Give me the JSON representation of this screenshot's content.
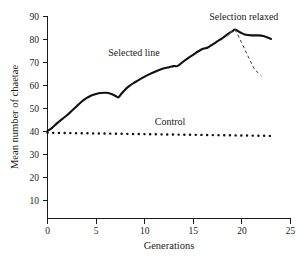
{
  "chart_data": {
    "type": "line",
    "title": "",
    "xlabel": "Generations",
    "ylabel": "Mean number of chaetae",
    "xlim": [
      0,
      25
    ],
    "ylim": [
      0,
      90
    ],
    "xticks": [
      0,
      5,
      10,
      15,
      20,
      25
    ],
    "yticks": [
      10,
      20,
      30,
      40,
      50,
      60,
      70,
      80,
      90
    ],
    "xtick_labels": [
      "0",
      "5",
      "10",
      "15",
      "20",
      "25"
    ],
    "ytick_labels": [
      "10",
      "20",
      "30",
      "40",
      "50",
      "60",
      "70",
      "80",
      "90"
    ],
    "grid": false,
    "legend_position": "inline-annotations",
    "series": [
      {
        "name": "Selected line",
        "style": "solid",
        "color": "#111111",
        "x": [
          0,
          0.5,
          1,
          1.5,
          2,
          2.5,
          3,
          3.5,
          4,
          4.5,
          5,
          5.5,
          6,
          6.5,
          7,
          7.3,
          7.6,
          8,
          8.5,
          9,
          9.5,
          10,
          10.5,
          11,
          11.5,
          12,
          12.5,
          13,
          13.4,
          14,
          14.5,
          15,
          15.5,
          16,
          16.5,
          17,
          17.5,
          18,
          18.5,
          19,
          19.3,
          19.8,
          20.3,
          21,
          21.6,
          22.2,
          23
        ],
        "y": [
          39.0,
          40.5,
          42.5,
          44.3,
          46.0,
          48.0,
          50.0,
          52.0,
          53.6,
          54.8,
          55.5,
          55.9,
          56.0,
          55.6,
          54.6,
          54.0,
          55.6,
          57.5,
          59.3,
          60.7,
          62.0,
          63.2,
          64.3,
          65.3,
          66.2,
          66.9,
          67.4,
          67.9,
          68.0,
          70.0,
          71.6,
          73.0,
          74.4,
          75.6,
          76.2,
          77.6,
          79.0,
          80.4,
          82.0,
          83.4,
          84.2,
          83.0,
          82.0,
          81.6,
          81.6,
          81.3,
          80.0
        ]
      },
      {
        "name": "Control",
        "style": "dotted",
        "color": "#111111",
        "x": [
          0,
          23
        ],
        "y": [
          38.2,
          36.8
        ]
      },
      {
        "name": "Selection relaxed",
        "style": "dashed",
        "color": "#3a3a3a",
        "x": [
          19.3,
          19.9,
          20.5,
          21.0,
          21.3,
          21.7,
          22.0
        ],
        "y": [
          84.2,
          79.0,
          73.5,
          69.0,
          66.5,
          64.8,
          63.6
        ]
      }
    ],
    "annotations": [
      {
        "text": "Selected line",
        "x": 8.9,
        "y": 72.5,
        "name": "selected-line-label"
      },
      {
        "text": "Control",
        "x": 12.6,
        "y": 41.5,
        "name": "control-label"
      },
      {
        "text": "Selection relaxed",
        "x": 20.2,
        "y": 88.5,
        "name": "selection-relaxed-label"
      }
    ]
  }
}
